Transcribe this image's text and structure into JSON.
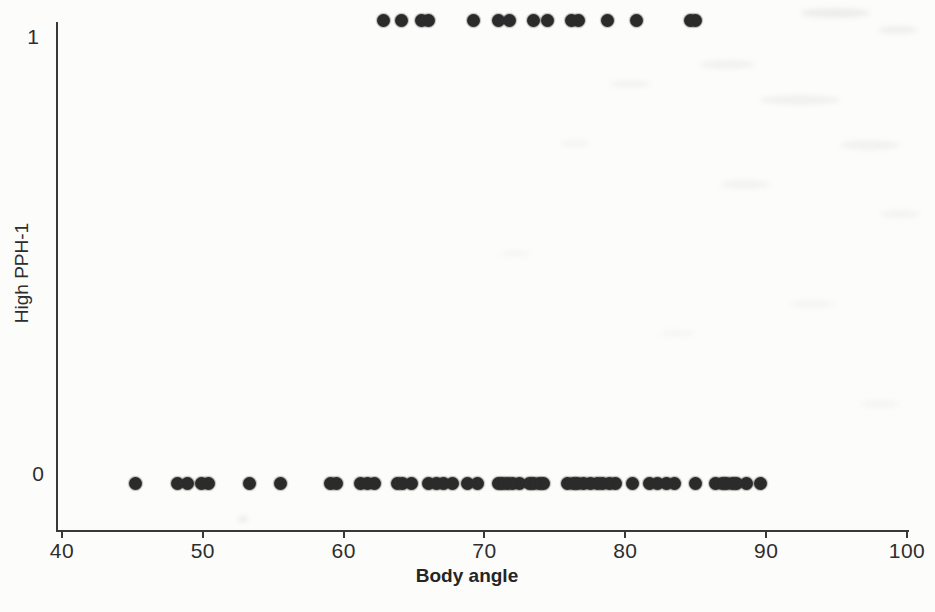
{
  "figure": {
    "background_color": "#fcfcfa",
    "axis_color": "#383838"
  },
  "chart_data": {
    "type": "scatter",
    "title": "",
    "xlabel": "Body angle",
    "ylabel": "High PPH-1",
    "xlim": [
      40,
      100
    ],
    "ylim": [
      0,
      1
    ],
    "grid": false,
    "legend": "none",
    "marker": "filled-circle",
    "marker_color": "#2b2b2b",
    "x_ticks": [
      40,
      50,
      60,
      70,
      80,
      90,
      100
    ],
    "x_tick_labels": [
      "40",
      "50",
      "60",
      "70",
      "80",
      "90",
      "100"
    ],
    "y_ticks": [
      0,
      1
    ],
    "y_tick_labels": [
      "0",
      "1"
    ],
    "series": [
      {
        "name": "High PPH-1 = 1",
        "y": 1,
        "x": [
          62.8,
          64.1,
          65.5,
          66.0,
          69.2,
          71.0,
          71.8,
          73.5,
          74.5,
          76.2,
          76.7,
          78.7,
          80.8,
          84.6,
          85.0
        ]
      },
      {
        "name": "High PPH-1 = 0",
        "y": 0,
        "x": [
          45.2,
          48.2,
          48.9,
          49.9,
          50.4,
          53.3,
          55.5,
          59.1,
          59.5,
          61.2,
          61.7,
          62.2,
          63.8,
          64.2,
          64.8,
          66.0,
          66.6,
          67.1,
          67.7,
          68.8,
          69.5,
          71.0,
          71.3,
          71.6,
          72.0,
          72.5,
          73.2,
          73.5,
          73.9,
          74.2,
          75.9,
          76.3,
          76.6,
          77.0,
          77.5,
          78.0,
          78.4,
          78.9,
          79.3,
          80.5,
          81.7,
          82.3,
          82.9,
          83.5,
          85.0,
          86.4,
          86.9,
          87.2,
          87.6,
          87.9,
          88.6,
          89.6
        ]
      }
    ]
  }
}
